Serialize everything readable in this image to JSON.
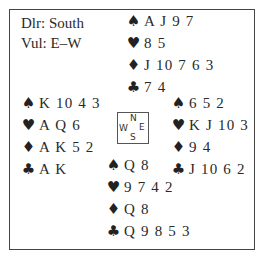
{
  "info": {
    "dealer": "Dlr: South",
    "vulnerability": "Vul: E–W"
  },
  "compass": {
    "north": "N",
    "south": "S",
    "west": "W",
    "east": "E"
  },
  "suit_symbols": {
    "spades": "♠",
    "hearts": "♥",
    "diamonds": "♦",
    "clubs": "♣"
  },
  "hands": {
    "north": {
      "spades": "A J 9 7",
      "hearts": "8 5",
      "diamonds": "J 10 7 6 3",
      "clubs": "7 4"
    },
    "west": {
      "spades": "K 10 4 3",
      "hearts": "A Q 6",
      "diamonds": "A K 5 2",
      "clubs": "A K"
    },
    "east": {
      "spades": "6 5 2",
      "hearts": "K J 10 3",
      "diamonds": "9 4",
      "clubs": "J 10 6 2"
    },
    "south": {
      "spades": "Q 8",
      "hearts": "9 7 4 2",
      "diamonds": "Q 8",
      "clubs": "Q 9 8 5 3"
    }
  }
}
